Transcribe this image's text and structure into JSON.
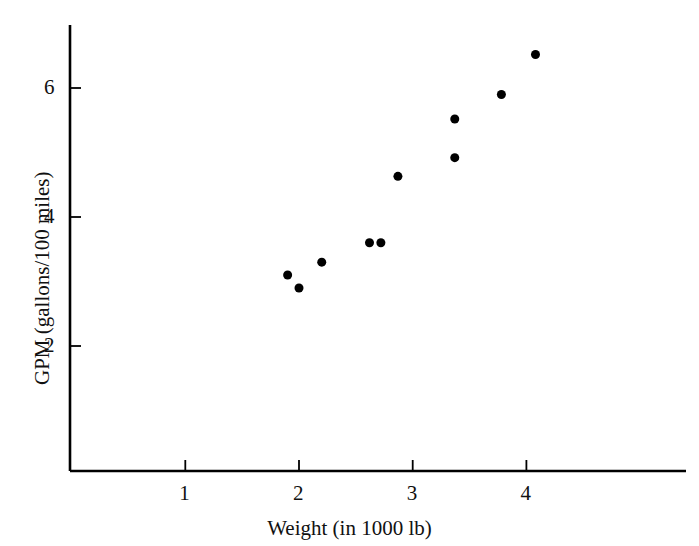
{
  "chart_data": {
    "type": "scatter",
    "title": "",
    "xlabel": "Weight (in 1000 lb)",
    "ylabel": "GPM (gallons/100 miles)",
    "xlim": [
      0.0,
      4.4
    ],
    "ylim": [
      0.0,
      7.0
    ],
    "xticks": [
      1,
      2,
      3,
      4
    ],
    "xtick_labels": [
      "1",
      "2",
      "3",
      "4"
    ],
    "yticks": [
      2,
      4,
      6
    ],
    "ytick_labels": [
      "2",
      "4",
      "6"
    ],
    "grid": false,
    "legend": null,
    "marker": {
      "shape": "circle",
      "color": "#000000",
      "radius_px": 4.5
    },
    "axis_color": "#000000",
    "points": [
      {
        "x": 1.9,
        "y": 3.1
      },
      {
        "x": 2.0,
        "y": 2.9
      },
      {
        "x": 2.2,
        "y": 3.3
      },
      {
        "x": 2.62,
        "y": 3.6
      },
      {
        "x": 2.72,
        "y": 3.6
      },
      {
        "x": 2.87,
        "y": 4.63
      },
      {
        "x": 3.37,
        "y": 4.92
      },
      {
        "x": 3.37,
        "y": 5.52
      },
      {
        "x": 3.78,
        "y": 5.9
      },
      {
        "x": 4.08,
        "y": 6.52
      }
    ]
  },
  "axes_geometry": {
    "origin_px": {
      "x": 70,
      "y": 471
    },
    "x_axis_end_px": 686,
    "y_axis_top_px": 25,
    "x_unit_px": 113.7,
    "y_unit_px": 64.5,
    "x_zero_px": 185.3,
    "y_zero_px": 475.0,
    "tick_len_px": 11
  }
}
